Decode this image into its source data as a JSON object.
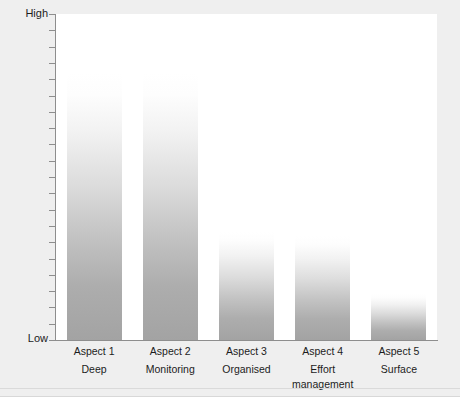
{
  "chart_data": {
    "type": "bar",
    "title": "",
    "subtitle": "",
    "xlabel": "",
    "ylabel": "Percentage score",
    "categories": [
      "Aspect 1",
      "Aspect 2",
      "Aspect 3",
      "Aspect 4",
      "Aspect 5"
    ],
    "category_subtitles": [
      "Deep",
      "Monitoring",
      "Organised",
      "Effort management",
      "Surface"
    ],
    "values": [
      82,
      82,
      33,
      32,
      14
    ],
    "ylim": [
      0,
      100
    ],
    "y_tick_labels": [
      "Low",
      "High"
    ],
    "y_tick_count": 21,
    "grid": false,
    "legend": null,
    "bar_fill": "linear-gradient white-to-gray",
    "bar_color_top": "#ffffff",
    "bar_color_bottom": "#a3a3a3",
    "axis_color": "#8e8e8e",
    "plot_background": "#ffffff",
    "figure_background": "#efefef",
    "text_color": "#1c1c1c"
  },
  "axes": {
    "y": {
      "title": "Percentage score",
      "high_label": "High",
      "low_label": "Low"
    }
  },
  "bars": [
    {
      "name": "Aspect 1",
      "sub": "Deep",
      "value": 82
    },
    {
      "name": "Aspect 2",
      "sub": "Monitoring",
      "value": 82
    },
    {
      "name": "Aspect 3",
      "sub": "Organised",
      "value": 33
    },
    {
      "name": "Aspect 4",
      "sub": "Effort management",
      "value": 32
    },
    {
      "name": "Aspect 5",
      "sub": "Surface",
      "value": 14
    }
  ]
}
